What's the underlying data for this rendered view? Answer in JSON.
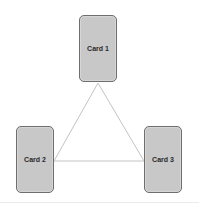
{
  "diagram": {
    "cards": [
      {
        "id": "card-1",
        "label": "Card 1"
      },
      {
        "id": "card-2",
        "label": "Card 2"
      },
      {
        "id": "card-3",
        "label": "Card 3"
      }
    ],
    "connections": [
      {
        "from": "Card 1",
        "to": "Card 2"
      },
      {
        "from": "Card 1",
        "to": "Card 3"
      },
      {
        "from": "Card 2",
        "to": "Card 3"
      }
    ],
    "colors": {
      "card_fill": "#c8c8c8",
      "card_border": "#6e6e6e",
      "line": "#c4c4c4"
    }
  }
}
